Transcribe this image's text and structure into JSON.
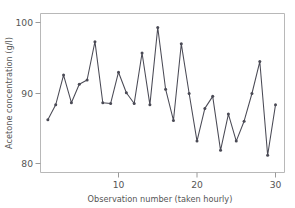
{
  "chart_data": {
    "type": "line",
    "title": "",
    "xlabel": "Observation number (taken hourly)",
    "ylabel": "Acetone concentration (g/l)",
    "xlim": [
      1,
      31
    ],
    "ylim": [
      78.5,
      101
    ],
    "xticks": [
      10,
      20,
      30
    ],
    "xtick_labels": [
      "10",
      "20",
      "30"
    ],
    "yticks": [
      80,
      90,
      100
    ],
    "ytick_labels": [
      "80",
      "90",
      "100"
    ],
    "grid": false,
    "legend": false,
    "markers": true,
    "line_color": "#4a4a55",
    "frame_color": "#b8b8b8",
    "x": [
      1,
      2,
      3,
      4,
      5,
      6,
      7,
      8,
      9,
      10,
      11,
      12,
      13,
      14,
      15,
      16,
      17,
      18,
      19,
      20,
      21,
      22,
      23,
      24,
      25,
      26,
      27,
      28,
      29,
      30
    ],
    "values": [
      86.3,
      88.4,
      92.6,
      88.7,
      91.3,
      91.9,
      97.3,
      88.7,
      88.6,
      93.0,
      90.1,
      88.6,
      95.7,
      88.4,
      99.3,
      90.6,
      86.2,
      97.0,
      90.0,
      83.3,
      87.9,
      89.6,
      82.0,
      87.1,
      83.3,
      86.1,
      90.0,
      94.5,
      81.3,
      88.4
    ],
    "series": [
      {
        "name": "Acetone concentration",
        "values": [
          86.3,
          88.4,
          92.6,
          88.7,
          91.3,
          91.9,
          97.3,
          88.7,
          88.6,
          93.0,
          90.1,
          88.6,
          95.7,
          88.4,
          99.3,
          90.6,
          86.2,
          97.0,
          90.0,
          83.3,
          87.9,
          89.6,
          82.0,
          87.1,
          83.3,
          86.1,
          90.0,
          94.5,
          81.3,
          88.4
        ]
      }
    ]
  },
  "axes": {
    "x_title": "Observation number (taken hourly)",
    "y_title": "Acetone concentration (g/l)",
    "x_tick_labels": [
      "10",
      "20",
      "30"
    ],
    "y_tick_labels": [
      "80",
      "90",
      "100"
    ]
  }
}
